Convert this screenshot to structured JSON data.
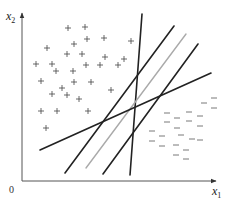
{
  "diagram": {
    "type": "linear-separating-hyperplanes",
    "axes": {
      "origin_label": "0",
      "x_axis": {
        "name": "x",
        "subscript": "1",
        "start": [
          22,
          181
        ],
        "end": [
          216,
          181
        ]
      },
      "y_axis": {
        "name": "x",
        "subscript": "2",
        "start": [
          22,
          181
        ],
        "end": [
          22,
          13
        ]
      },
      "color": "#555555"
    },
    "positive_class": {
      "marker": "+",
      "color": "#444444",
      "points": [
        [
          68,
          28
        ],
        [
          85,
          27
        ],
        [
          87,
          39
        ],
        [
          104,
          38
        ],
        [
          74,
          44
        ],
        [
          47,
          48
        ],
        [
          67,
          54
        ],
        [
          82,
          54
        ],
        [
          105,
          57
        ],
        [
          124,
          59
        ],
        [
          36,
          64
        ],
        [
          52,
          64
        ],
        [
          86,
          65
        ],
        [
          100,
          65
        ],
        [
          118,
          65
        ],
        [
          56,
          71
        ],
        [
          73,
          71
        ],
        [
          131,
          41
        ],
        [
          41,
          81
        ],
        [
          74,
          82
        ],
        [
          91,
          82
        ],
        [
          62,
          88
        ],
        [
          111,
          90
        ],
        [
          52,
          94
        ],
        [
          67,
          95
        ],
        [
          79,
          99
        ],
        [
          41,
          111
        ],
        [
          57,
          111
        ],
        [
          88,
          111
        ],
        [
          46,
          128
        ]
      ]
    },
    "negative_class": {
      "marker": "−",
      "color": "#555555",
      "points": [
        [
          214,
          98
        ],
        [
          204,
          103
        ],
        [
          214,
          108
        ],
        [
          167,
          113
        ],
        [
          189,
          112
        ],
        [
          200,
          116
        ],
        [
          177,
          118
        ],
        [
          167,
          122
        ],
        [
          189,
          121
        ],
        [
          200,
          126
        ],
        [
          177,
          128
        ],
        [
          152,
          131
        ],
        [
          181,
          135
        ],
        [
          162,
          136
        ],
        [
          192,
          139
        ],
        [
          200,
          140
        ],
        [
          152,
          141
        ],
        [
          162,
          146
        ],
        [
          176,
          145
        ],
        [
          186,
          150
        ],
        [
          176,
          155
        ],
        [
          186,
          159
        ]
      ]
    },
    "hyperplanes": [
      {
        "name": "line-near-vertical",
        "x1": 142,
        "y1": 14,
        "x2": 130,
        "y2": 175,
        "color": "#222222",
        "width": 1.6
      },
      {
        "name": "line-steep-left",
        "x1": 174,
        "y1": 26,
        "x2": 65,
        "y2": 173,
        "color": "#222222",
        "width": 1.6
      },
      {
        "name": "line-optimal-grey",
        "x1": 186,
        "y1": 34,
        "x2": 86,
        "y2": 168,
        "color": "#aaaaaa",
        "width": 1.4
      },
      {
        "name": "line-steep-right",
        "x1": 198,
        "y1": 44,
        "x2": 103,
        "y2": 174,
        "color": "#222222",
        "width": 1.6
      },
      {
        "name": "line-shallow",
        "x1": 40,
        "y1": 150,
        "x2": 211,
        "y2": 73,
        "color": "#222222",
        "width": 1.6
      }
    ]
  },
  "labels": {
    "x1_main": "x",
    "x1_sub": "1",
    "x2_main": "x",
    "x2_sub": "2",
    "origin": "0"
  }
}
